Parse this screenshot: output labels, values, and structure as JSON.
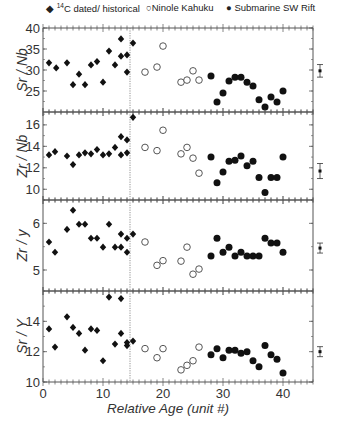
{
  "legend": [
    {
      "marker": "diamond-filled",
      "label_sup": "14",
      "label": "C dated/ historical"
    },
    {
      "marker": "circle-open",
      "label": "Ninole Kahuku"
    },
    {
      "marker": "circle-filled",
      "label": "Submarine SW Rift"
    }
  ],
  "chart_data": {
    "type": "scatter",
    "title": "",
    "xlabel": "Relative Age (unit #)",
    "xlim": [
      0,
      45
    ],
    "xticks": [
      0,
      10,
      20,
      30,
      40
    ],
    "divider_x": 14.5,
    "series_names": [
      "14C dated/ historical",
      "Ninole Kahuku",
      "Submarine SW Rift"
    ],
    "panels": [
      {
        "ylabel": "Sr / Nb",
        "ylim": [
          20,
          40
        ],
        "yticks": [
          25,
          30,
          35,
          40
        ],
        "error_bar": {
          "x": 46,
          "y": 29.8,
          "err": 1.5
        },
        "series": [
          {
            "name": "14C dated/ historical",
            "x": [
              1,
              2.2,
              4,
              5,
              6,
              7,
              8,
              9,
              10,
              11,
              12,
              13,
              13,
              14,
              14,
              15
            ],
            "y": [
              31.7,
              30.5,
              31.7,
              26.5,
              29.0,
              26.5,
              31.2,
              32.0,
              27.1,
              34.5,
              31.2,
              37.4,
              33.3,
              33.6,
              29.5,
              36.4
            ]
          },
          {
            "name": "Ninole Kahuku",
            "x": [
              17,
              19,
              20,
              23,
              24,
              25,
              26
            ],
            "y": [
              29.5,
              30.7,
              35.7,
              27.1,
              27.6,
              29.8,
              27.6
            ]
          },
          {
            "name": "Submarine SW Rift",
            "x": [
              28,
              29,
              30,
              31,
              32,
              33,
              34,
              35,
              36,
              37,
              38,
              39,
              40
            ],
            "y": [
              28.6,
              22.4,
              24.5,
              27.4,
              28.3,
              28.3,
              27.1,
              26.2,
              22.9,
              21.2,
              23.6,
              22.4,
              25.0
            ]
          }
        ]
      },
      {
        "ylabel": "Zr / Nb",
        "ylim": [
          9,
          17.2
        ],
        "yticks": [
          10,
          12,
          14,
          16
        ],
        "error_bar": {
          "x": 46,
          "y": 11.7,
          "err": 0.7
        },
        "series": [
          {
            "name": "14C dated/ historical",
            "x": [
              1,
              2,
              4,
              5,
              6,
              7,
              8,
              9,
              10,
              11,
              12,
              13,
              13,
              14,
              14,
              15
            ],
            "y": [
              13.2,
              13.5,
              13.1,
              12.3,
              13.2,
              13.4,
              13.3,
              13.7,
              13.2,
              13.3,
              13.9,
              14.9,
              13.2,
              14.6,
              13.4,
              16.7
            ]
          },
          {
            "name": "Ninole Kahuku",
            "x": [
              17,
              19,
              20,
              23,
              24,
              25,
              26
            ],
            "y": [
              13.9,
              13.6,
              15.5,
              13.3,
              13.9,
              12.9,
              11.5
            ]
          },
          {
            "name": "Submarine SW Rift",
            "x": [
              28,
              29,
              30,
              31,
              32,
              33,
              34,
              35,
              36,
              37,
              38,
              39,
              40
            ],
            "y": [
              13.0,
              10.6,
              11.6,
              12.6,
              12.7,
              13.1,
              12.2,
              12.6,
              11.1,
              9.7,
              11.1,
              11.1,
              13.0
            ]
          }
        ]
      },
      {
        "ylabel": "Zr / y",
        "ylim": [
          4.55,
          6.5
        ],
        "yticks": [
          5,
          6
        ],
        "error_bar": {
          "x": 46,
          "y": 5.47,
          "err": 0.1
        },
        "series": [
          {
            "name": "14C dated/ historical",
            "x": [
              1,
              2,
              4,
              5,
              6,
              7,
              8,
              9,
              10,
              11,
              12,
              13,
              13,
              14,
              14,
              15
            ],
            "y": [
              5.6,
              5.38,
              5.87,
              6.28,
              5.98,
              5.98,
              5.68,
              5.68,
              5.49,
              5.98,
              5.49,
              5.77,
              5.49,
              5.68,
              5.38,
              5.77
            ]
          },
          {
            "name": "Ninole Kahuku",
            "x": [
              17,
              19,
              20,
              23,
              24,
              25,
              26
            ],
            "y": [
              5.6,
              5.1,
              5.2,
              5.19,
              5.49,
              4.91,
              5.02
            ]
          },
          {
            "name": "Submarine SW Rift",
            "x": [
              28,
              29,
              30,
              31,
              32,
              33,
              34,
              35,
              36,
              37,
              38,
              39,
              40
            ],
            "y": [
              5.3,
              5.68,
              5.38,
              5.49,
              5.3,
              5.38,
              5.3,
              5.3,
              5.3,
              5.68,
              5.58,
              5.58,
              5.38
            ]
          }
        ]
      },
      {
        "ylabel": "Sr / Y",
        "ylim": [
          10,
          16
        ],
        "yticks": [
          10,
          12,
          14
        ],
        "error_bar": {
          "x": 46,
          "y": 12.0,
          "err": 0.3
        },
        "series": [
          {
            "name": "14C dated/ historical",
            "x": [
              1,
              2,
              4,
              5,
              6,
              7,
              8,
              9,
              10,
              11,
              12,
              13,
              13,
              14,
              14,
              15
            ],
            "y": [
              13.5,
              12.3,
              14.3,
              13.6,
              13.2,
              12.1,
              13.5,
              13.4,
              11.4,
              15.6,
              12.5,
              15.5,
              13.2,
              12.6,
              12.4,
              12.7
            ]
          },
          {
            "name": "Ninole Kahuku",
            "x": [
              17,
              19,
              20,
              23,
              24,
              25,
              26
            ],
            "y": [
              12.2,
              11.6,
              12.2,
              10.8,
              11.1,
              11.4,
              12.3
            ]
          },
          {
            "name": "Submarine SW Rift",
            "x": [
              28,
              29,
              30,
              31,
              32,
              33,
              34,
              35,
              36,
              37,
              38,
              39,
              40
            ],
            "y": [
              11.8,
              12.2,
              11.6,
              12.1,
              12.1,
              11.9,
              12.0,
              11.4,
              11.0,
              12.4,
              11.8,
              11.5,
              10.6
            ]
          }
        ]
      }
    ]
  },
  "colors": {
    "axis": "#555555",
    "marker": "#111111",
    "divider": "#777777"
  }
}
